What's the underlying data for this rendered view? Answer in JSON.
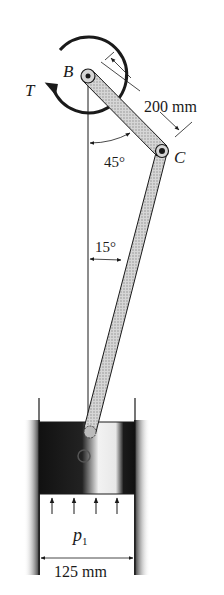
{
  "figure": {
    "type": "slider-crank mechanism",
    "labels": {
      "pin_b": "B",
      "pin_c": "C",
      "torque": "T",
      "pressure_main": "p",
      "pressure_sub": "1"
    },
    "dimensions": {
      "link_bc_length": "200 mm",
      "bore_diameter": "125 mm"
    },
    "angles": {
      "link_bc_from_vertical": "45°",
      "link_cd_from_vertical": "15°"
    },
    "colors": {
      "ink": "#1a1a1a",
      "link_fill": "#bdbdbd",
      "cylinder_dark": "#111111",
      "background": "#ffffff"
    }
  }
}
